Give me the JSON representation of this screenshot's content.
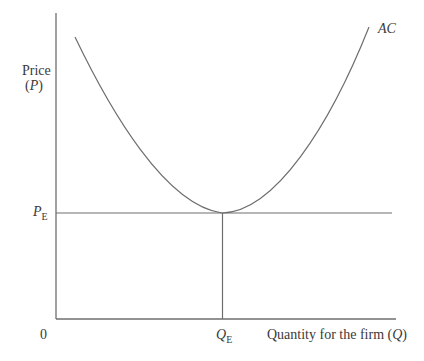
{
  "diagram": {
    "type": "economics-cost-curve",
    "curve_label": "AC",
    "y_axis_label": "Price",
    "y_axis_symbol": "P",
    "x_axis_label": "Quantity for the firm",
    "x_axis_symbol": "Q",
    "origin_label": "0",
    "price_equilibrium": {
      "symbol": "P",
      "subscript": "E"
    },
    "quantity_equilibrium": {
      "symbol": "Q",
      "subscript": "E"
    },
    "colors": {
      "line": "#6e6e6e",
      "text": "#3a3a3a"
    }
  }
}
